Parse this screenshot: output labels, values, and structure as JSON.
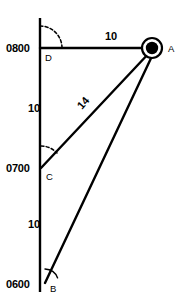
{
  "figure": {
    "background_color": "#ffffff",
    "ink_color": "#000000",
    "width": 183,
    "height": 299
  },
  "axis": {
    "name": "own-ship-track",
    "orientation": "vertical",
    "x": 40,
    "y_top": 18,
    "y_bottom": 292
  },
  "time_labels": [
    {
      "id": "t0800",
      "text": "0800",
      "x": 6,
      "y": 52,
      "tick_y": 48
    },
    {
      "id": "t0700",
      "text": "0700",
      "x": 6,
      "y": 172,
      "tick_y": 168
    },
    {
      "id": "t0600",
      "text": "0600",
      "x": 6,
      "y": 288,
      "tick_y": 284
    }
  ],
  "segment_labels": [
    {
      "id": "seg-da",
      "text": "10",
      "x": 105,
      "y": 40,
      "rotation": 0,
      "note": "distance along D-A"
    },
    {
      "id": "seg-dc",
      "text": "10",
      "x": 28,
      "y": 112,
      "rotation": 0,
      "note": "distance D to C on track"
    },
    {
      "id": "seg-cb",
      "text": "10",
      "x": 28,
      "y": 228,
      "rotation": 0,
      "note": "distance C to B on track"
    },
    {
      "id": "seg-ca",
      "text": "14",
      "x": 82,
      "y": 110,
      "rotation": -49,
      "note": "range along C-A"
    }
  ],
  "points": [
    {
      "id": "A",
      "label": "A",
      "x": 152,
      "y": 48,
      "label_x": 168,
      "label_y": 52,
      "style": "target-marker"
    },
    {
      "id": "D",
      "label": "D",
      "x": 41,
      "y": 48,
      "label_x": 45,
      "label_y": 61,
      "style": "plain"
    },
    {
      "id": "C",
      "label": "C",
      "x": 41,
      "y": 168,
      "label_x": 46,
      "label_y": 180,
      "style": "plain"
    },
    {
      "id": "B",
      "label": "B",
      "x": 45,
      "y": 283,
      "label_x": 50,
      "label_y": 292,
      "style": "plain"
    }
  ],
  "rays": [
    {
      "id": "ray-d-a",
      "from": "D",
      "to": "A",
      "x1": 40,
      "y1": 48,
      "x2": 152,
      "y2": 48
    },
    {
      "id": "ray-c-a",
      "from": "C",
      "to": "A",
      "x1": 41,
      "y1": 168,
      "x2": 150,
      "y2": 52
    },
    {
      "id": "ray-b-a",
      "from": "B",
      "to": "A",
      "x1": 45,
      "y1": 283,
      "x2": 153,
      "y2": 54
    }
  ],
  "angle_arcs": [
    {
      "id": "arc-d",
      "at": "D",
      "cx": 40,
      "cy": 48,
      "radius": 22,
      "start_deg": -90,
      "end_deg": 0,
      "style": "dashed"
    },
    {
      "id": "arc-c",
      "at": "C",
      "cx": 41,
      "cy": 168,
      "radius": 22,
      "start_deg": -90,
      "end_deg": -47,
      "style": "dashed"
    },
    {
      "id": "arc-b",
      "at": "B",
      "cx": 45,
      "cy": 283,
      "radius": 14,
      "start_deg": -90,
      "end_deg": -64,
      "style": "solid"
    }
  ],
  "marker_a": {
    "name": "target-marker-a",
    "outer_radius": 10,
    "inner_radius": 6.2
  }
}
